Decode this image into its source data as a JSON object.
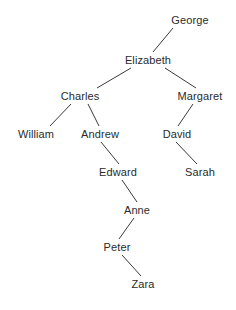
{
  "diagram": {
    "type": "family-tree",
    "background_color": "#ffffff",
    "text_color": "#2b2b2b",
    "edge_color": "#3a3a3a",
    "nodes": [
      {
        "id": "george",
        "label": "George",
        "x": 190,
        "y": 20
      },
      {
        "id": "elizabeth",
        "label": "Elizabeth",
        "x": 148,
        "y": 60
      },
      {
        "id": "charles",
        "label": "Charles",
        "x": 80,
        "y": 96
      },
      {
        "id": "margaret",
        "label": "Margaret",
        "x": 200,
        "y": 96
      },
      {
        "id": "william",
        "label": "William",
        "x": 36,
        "y": 134
      },
      {
        "id": "andrew",
        "label": "Andrew",
        "x": 100,
        "y": 134
      },
      {
        "id": "david",
        "label": "David",
        "x": 177,
        "y": 134
      },
      {
        "id": "edward",
        "label": "Edward",
        "x": 118,
        "y": 172
      },
      {
        "id": "sarah",
        "label": "Sarah",
        "x": 200,
        "y": 172
      },
      {
        "id": "anne",
        "label": "Anne",
        "x": 137,
        "y": 210
      },
      {
        "id": "peter",
        "label": "Peter",
        "x": 117,
        "y": 247
      },
      {
        "id": "zara",
        "label": "Zara",
        "x": 143,
        "y": 284
      }
    ],
    "edges": [
      {
        "from": "george",
        "to": "elizabeth",
        "x1": 173,
        "y1": 28,
        "x2": 153,
        "y2": 52
      },
      {
        "from": "elizabeth",
        "to": "charles",
        "x1": 131,
        "y1": 68,
        "x2": 97,
        "y2": 88
      },
      {
        "from": "elizabeth",
        "to": "margaret",
        "x1": 165,
        "y1": 68,
        "x2": 196,
        "y2": 88
      },
      {
        "from": "charles",
        "to": "william",
        "x1": 71,
        "y1": 104,
        "x2": 50,
        "y2": 126
      },
      {
        "from": "charles",
        "to": "andrew",
        "x1": 88,
        "y1": 104,
        "x2": 99,
        "y2": 126
      },
      {
        "from": "margaret",
        "to": "david",
        "x1": 193,
        "y1": 104,
        "x2": 178,
        "y2": 126
      },
      {
        "from": "andrew",
        "to": "edward",
        "x1": 101,
        "y1": 142,
        "x2": 119,
        "y2": 164
      },
      {
        "from": "david",
        "to": "sarah",
        "x1": 176,
        "y1": 142,
        "x2": 197,
        "y2": 164
      },
      {
        "from": "edward",
        "to": "anne",
        "x1": 122,
        "y1": 180,
        "x2": 137,
        "y2": 202
      },
      {
        "from": "anne",
        "to": "peter",
        "x1": 134,
        "y1": 218,
        "x2": 119,
        "y2": 239
      },
      {
        "from": "peter",
        "to": "zara",
        "x1": 122,
        "y1": 255,
        "x2": 141,
        "y2": 276
      }
    ]
  }
}
